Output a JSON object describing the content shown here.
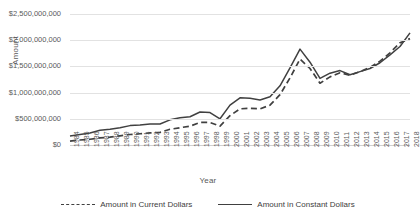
{
  "chart_data": {
    "type": "line",
    "title": "",
    "xlabel": "Year",
    "ylabel": "Amount",
    "ylim": [
      0,
      2500000000
    ],
    "ytick_labels": [
      "$2,500,000,000",
      "$2,000,000,000",
      "$1,500,000,000",
      "$1,000,000,000",
      "$500,000,000",
      "$0"
    ],
    "ytick_values": [
      2500000000,
      2000000000,
      1500000000,
      1000000000,
      500000000,
      0
    ],
    "grid": true,
    "legend_position": "bottom",
    "categories": [
      "1984",
      "1985",
      "1986",
      "1987",
      "1988",
      "1989",
      "1990",
      "1991",
      "1992",
      "1993",
      "1994",
      "1995",
      "1996",
      "1997",
      "1998",
      "1999",
      "2000",
      "2001",
      "2002",
      "2003",
      "2004",
      "2005",
      "2006",
      "2007",
      "2008",
      "2009",
      "2010",
      "2011",
      "2012",
      "2013",
      "2014",
      "2015",
      "2016",
      "2017",
      "2018"
    ],
    "series": [
      {
        "name": "Amount in Current Dollars",
        "style": "dashed",
        "color": "#404040",
        "values": [
          75000000,
          95000000,
          110000000,
          135000000,
          150000000,
          175000000,
          200000000,
          215000000,
          230000000,
          240000000,
          300000000,
          330000000,
          360000000,
          430000000,
          430000000,
          360000000,
          560000000,
          690000000,
          700000000,
          690000000,
          760000000,
          960000000,
          1280000000,
          1640000000,
          1460000000,
          1180000000,
          1300000000,
          1380000000,
          1330000000,
          1400000000,
          1480000000,
          1600000000,
          1760000000,
          1950000000,
          2030000000
        ]
      },
      {
        "name": "Amount in Constant Dollars",
        "style": "solid",
        "color": "#404040",
        "values": [
          170000000,
          200000000,
          230000000,
          280000000,
          300000000,
          330000000,
          370000000,
          380000000,
          400000000,
          400000000,
          480000000,
          520000000,
          540000000,
          630000000,
          620000000,
          500000000,
          760000000,
          900000000,
          890000000,
          860000000,
          920000000,
          1130000000,
          1470000000,
          1830000000,
          1580000000,
          1270000000,
          1370000000,
          1420000000,
          1340000000,
          1400000000,
          1460000000,
          1570000000,
          1720000000,
          1880000000,
          2140000000
        ]
      }
    ]
  }
}
